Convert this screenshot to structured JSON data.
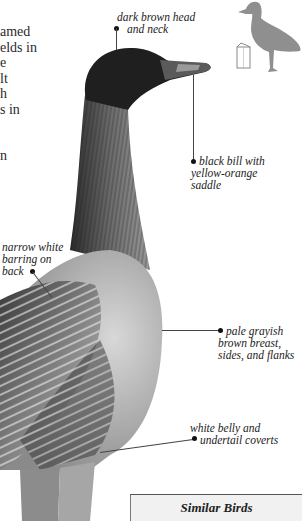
{
  "body_text": {
    "lines": [
      "amed",
      "elds in",
      "e",
      "lt",
      "h",
      "s in",
      "",
      "",
      "n"
    ]
  },
  "labels": {
    "head": [
      "dark brown head",
      "and neck"
    ],
    "bill": [
      "black bill with",
      "yellow-orange",
      "saddle"
    ],
    "back": [
      "narrow white",
      "barring on",
      "back"
    ],
    "breast": [
      "pale grayish",
      "brown breast,",
      "sides, and flanks"
    ],
    "belly": [
      "white belly and",
      "undertail coverts"
    ]
  },
  "similar_birds": {
    "title": "Similar Birds"
  },
  "icons": {
    "silhouette": "goose-silhouette-icon",
    "book": "book-icon"
  },
  "colors": {
    "silhouette": "#8f8f8f",
    "similar_box_bg": "#f1f1f1"
  }
}
